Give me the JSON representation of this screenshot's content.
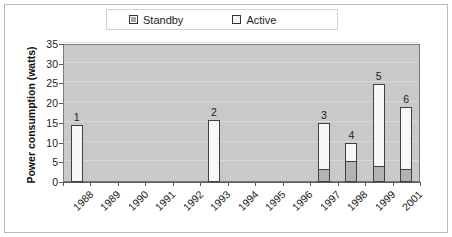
{
  "chart_data": {
    "type": "bar",
    "subtype": "stacked-vertical",
    "title": "",
    "xlabel": "",
    "ylabel": "Power consumption (watts)",
    "ylim": [
      0,
      35
    ],
    "ytick_values": [
      0,
      5,
      10,
      15,
      20,
      25,
      30,
      35
    ],
    "ytick_labels": [
      "0",
      "5",
      "10",
      "15",
      "20",
      "25",
      "30",
      "35"
    ],
    "grid": true,
    "grid_axis": "y",
    "legend_position": "top-center",
    "categories": [
      "1988",
      "1989",
      "1990",
      "1991",
      "1992",
      "1993",
      "1994",
      "1995",
      "1996",
      "1997",
      "1998",
      "1999",
      "2001"
    ],
    "series": [
      {
        "name": "Standby",
        "color": "#b3b3b3",
        "values": [
          0,
          0,
          0,
          0,
          0,
          0,
          0,
          0,
          0,
          3.0,
          5.2,
          3.7,
          2.8
        ]
      },
      {
        "name": "Active",
        "color": "#f7f7f7",
        "values": [
          14.5,
          0,
          0,
          0,
          0,
          15.8,
          0,
          0,
          0,
          12.0,
          4.6,
          21.2,
          16.2
        ]
      }
    ],
    "totals": [
      14.5,
      0,
      0,
      0,
      0,
      15.8,
      0,
      0,
      0,
      15.0,
      9.8,
      24.9,
      19.0
    ],
    "point_labels": [
      "1",
      "",
      "",
      "",
      "",
      "2",
      "",
      "",
      "",
      "3",
      "4",
      "5",
      "6"
    ],
    "annotations": [
      {
        "category": "1988",
        "label": "1",
        "total": 14.5
      },
      {
        "category": "1993",
        "label": "2",
        "total": 15.8
      },
      {
        "category": "1997",
        "label": "3",
        "total": 15.0
      },
      {
        "category": "1998",
        "label": "4",
        "total": 9.8
      },
      {
        "category": "1999",
        "label": "5",
        "total": 24.9
      },
      {
        "category": "2001",
        "label": "6",
        "total": 19.0
      }
    ],
    "colors": {
      "plot_background": "#c9c9c9",
      "gridline": "#d8d8d8",
      "axis": "#5a5a5a",
      "frame": "#b9b9b9",
      "bar_outline": "#404040"
    }
  },
  "legend": {
    "entries": [
      {
        "label": "Standby",
        "swatch": "standby-swatch"
      },
      {
        "label": "Active",
        "swatch": "active-swatch"
      }
    ]
  }
}
